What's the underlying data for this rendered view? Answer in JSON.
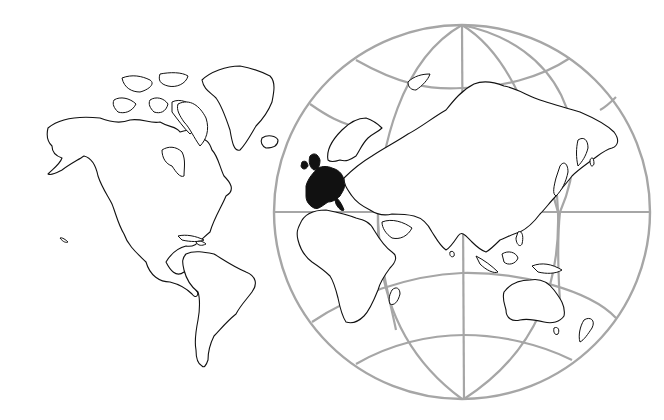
{
  "map": {
    "type": "world-outline-map",
    "projections": [
      {
        "name": "western-hemisphere",
        "style": "outline-no-graticule"
      },
      {
        "name": "eastern-hemisphere-globe",
        "style": "outline-with-graticule"
      }
    ],
    "highlighted_region": {
      "name": "Western Europe",
      "fill_color": "#111111"
    },
    "colors": {
      "background": "#ffffff",
      "coastline": "#111111",
      "graticule": "#a6a6a6",
      "highlight": "#111111"
    },
    "globe": {
      "center_x": 462,
      "center_y": 212,
      "radius_x": 188,
      "radius_y": 187
    },
    "labels": []
  }
}
